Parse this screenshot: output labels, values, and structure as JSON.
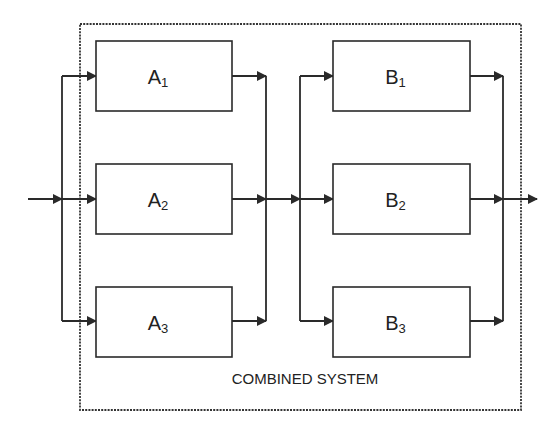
{
  "diagram": {
    "caption": "COMBINED SYSTEM",
    "stage_a": [
      {
        "letter": "A",
        "index": "1"
      },
      {
        "letter": "A",
        "index": "2"
      },
      {
        "letter": "A",
        "index": "3"
      }
    ],
    "stage_b": [
      {
        "letter": "B",
        "index": "1"
      },
      {
        "letter": "B",
        "index": "2"
      },
      {
        "letter": "B",
        "index": "3"
      }
    ],
    "colors": {
      "line": "#2a2a2a",
      "background": "#ffffff"
    }
  }
}
